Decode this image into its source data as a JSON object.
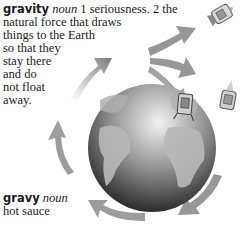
{
  "entries": [
    {
      "word": "gravity",
      "part_of_speech": "noun",
      "lines": [
        " 1 seriousness. 2 the",
        "natural force that draws",
        "things to the Earth",
        "so that they",
        "stay there",
        "and do",
        "not float",
        "away."
      ]
    },
    {
      "word": "gravy",
      "part_of_speech": "noun",
      "lines": [
        "hot sauce"
      ]
    }
  ],
  "illustration": {
    "subject": "globe-with-orbiting-arrows-and-spacecraft",
    "colors": {
      "globe_dark": "#2a2a2a",
      "globe_light": "#e8e8e8",
      "land": "#b4b4b4",
      "arrow": "#8a8a8a"
    }
  }
}
